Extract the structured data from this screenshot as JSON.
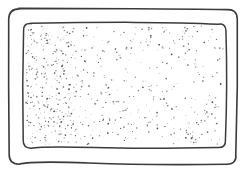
{
  "illustration": {
    "description": "hand-drawn stippled tray",
    "stroke_color": "#3a3a3a",
    "dot_color": "#4a4a4a",
    "background_color": "#ffffff",
    "outer_frame": {
      "x": 9,
      "y": 9,
      "width": 228,
      "height": 155,
      "radius": 10
    },
    "inner_panel": {
      "x": 23,
      "y": 23,
      "width": 203,
      "height": 125,
      "radius": 8
    },
    "stipple_count": 650
  }
}
